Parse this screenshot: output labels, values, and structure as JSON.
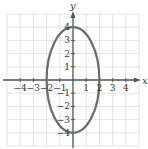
{
  "chart_data": {
    "type": "line",
    "title": "",
    "xlabel": "x",
    "ylabel": "y",
    "xlim": [
      -5,
      5
    ],
    "ylim": [
      -5,
      5
    ],
    "grid": true,
    "x_ticks": [
      -4,
      -3,
      -2,
      -1,
      1,
      2,
      3,
      4
    ],
    "y_ticks": [
      -4,
      -3,
      -2,
      -1,
      1,
      2,
      3,
      4
    ],
    "x_tick_labels": [
      "−4",
      "−3",
      "−2",
      "−1",
      "1",
      "2",
      "3",
      "4"
    ],
    "y_tick_labels": [
      "−4",
      "−3",
      "−2",
      "−1",
      "1",
      "2",
      "3",
      "4"
    ],
    "series": [
      {
        "name": "ellipse",
        "equation": "x^2/4 + y^2/16 = 1",
        "center": [
          0,
          0
        ],
        "semi_axis_x": 2,
        "semi_axis_y": 4,
        "points": [
          [
            2,
            0
          ],
          [
            0,
            4
          ],
          [
            -2,
            0
          ],
          [
            0,
            -4
          ]
        ]
      }
    ]
  },
  "colors": {
    "grid": "#dcdcdc",
    "axis": "#555555",
    "curve": "#6b6b6b",
    "text": "#333333"
  },
  "layout": {
    "origin_px": [
      73,
      80
    ],
    "unit_px": 13.2
  }
}
